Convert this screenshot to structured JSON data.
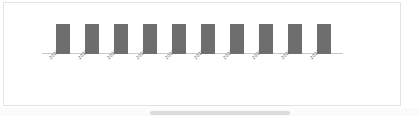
{
  "panel": {
    "border_color": "#e3e3e3",
    "background_color": "#ffffff"
  },
  "chart_data": {
    "type": "bar",
    "title": "",
    "subtitle": "",
    "xlabel": "",
    "ylabel": "",
    "grid": false,
    "legend": null,
    "axis_line_color": "#c9c9c9",
    "bar_color": "#6e6e6e",
    "label_color": "#6d6d6d",
    "label_rotation_deg": -45,
    "ylim": [
      0,
      1.1
    ],
    "categories": [
      "2020年4月",
      "2020年5月",
      "2020年6月",
      "2020年7月",
      "2020年8月",
      "2020年9月",
      "2020年10月",
      "2020年11月",
      "2020年12月",
      "2021年1月"
    ],
    "values": [
      1,
      1,
      1,
      1,
      1,
      1,
      1,
      1,
      1,
      1
    ]
  },
  "scrollbar": {
    "orientation": "horizontal",
    "thumb_color": "#dcdcdc",
    "track_color": "#fbfbfb"
  }
}
